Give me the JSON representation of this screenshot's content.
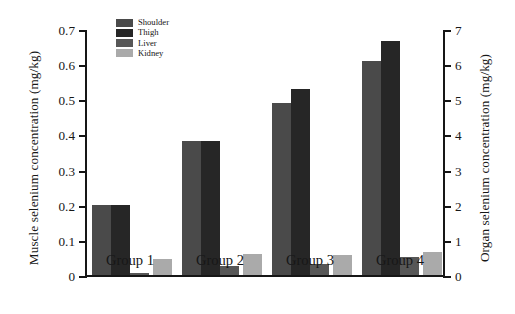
{
  "chart_data": {
    "type": "bar",
    "title": "",
    "categories": [
      "Group 1",
      "Group 2",
      "Group 3",
      "Group 4"
    ],
    "series": [
      {
        "name": "Shoulder",
        "axis": "left",
        "color": "#4a4a4a",
        "values": [
          0.2,
          0.38,
          0.49,
          0.61
        ]
      },
      {
        "name": "Thigh",
        "axis": "left",
        "color": "#262626",
        "values": [
          0.2,
          0.38,
          0.53,
          0.665
        ]
      },
      {
        "name": "Liver",
        "axis": "right",
        "color": "#575757",
        "values": [
          0.07,
          0.25,
          0.32,
          0.51
        ]
      },
      {
        "name": "Kidney",
        "axis": "right",
        "color": "#aaaaaa",
        "values": [
          0.45,
          0.59,
          0.58,
          0.645
        ]
      }
    ],
    "left_axis": {
      "label": "Muscle selenium concentration (mg/kg)",
      "ticks": [
        "0",
        "0.1",
        "0.2",
        "0.3",
        "0.4",
        "0.5",
        "0.6",
        "0.7"
      ],
      "tick_values": [
        0,
        0.1,
        0.2,
        0.3,
        0.4,
        0.5,
        0.6,
        0.7
      ],
      "lim": [
        0,
        0.7
      ]
    },
    "right_axis": {
      "label": "Organ selenium concentration (mg/kg)",
      "ticks": [
        "0",
        "1",
        "2",
        "3",
        "4",
        "5",
        "6",
        "7"
      ],
      "tick_values": [
        0,
        1,
        2,
        3,
        4,
        5,
        6,
        7
      ],
      "lim": [
        0,
        7
      ]
    },
    "xlabel": "",
    "grid": false,
    "legend_position": "top-left-inside"
  },
  "legend": {
    "items": [
      {
        "label": "Shoulder",
        "color": "#4a4a4a"
      },
      {
        "label": "Thigh",
        "color": "#262626"
      },
      {
        "label": "Liver",
        "color": "#575757"
      },
      {
        "label": "Kidney",
        "color": "#aaaaaa"
      }
    ]
  }
}
